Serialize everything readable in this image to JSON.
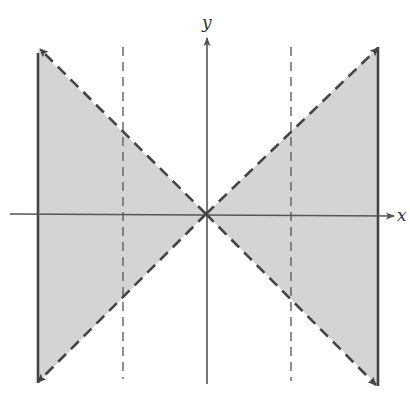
{
  "figure": {
    "type": "graph-of-inequality-region",
    "axes": {
      "x_label": "x",
      "y_label": "y"
    },
    "colors": {
      "shade": "#d4d4d4",
      "line": "#444444",
      "axis": "#555555",
      "background": "#ffffff"
    },
    "geometry": {
      "origin": [
        206,
        214
      ],
      "left_bound_x": 38,
      "right_bound_x": 378,
      "left_dashed_x": 123,
      "right_dashed_x": 291,
      "top_y_left": 49,
      "top_y_right": 47,
      "bottom_y_left": 383,
      "bottom_y_right": 386
    },
    "elements": [
      {
        "name": "left-shaded-triangle",
        "style": "shaded"
      },
      {
        "name": "right-shaded-triangle",
        "style": "shaded"
      },
      {
        "name": "line-y-equals-x",
        "style": "dashed-with-arrows"
      },
      {
        "name": "line-y-equals-neg-x",
        "style": "dashed-with-arrows"
      },
      {
        "name": "left-vertical-boundary",
        "style": "solid"
      },
      {
        "name": "right-vertical-boundary",
        "style": "solid"
      },
      {
        "name": "left-vertical-guide",
        "style": "thin-dashed"
      },
      {
        "name": "right-vertical-guide",
        "style": "thin-dashed"
      }
    ]
  }
}
